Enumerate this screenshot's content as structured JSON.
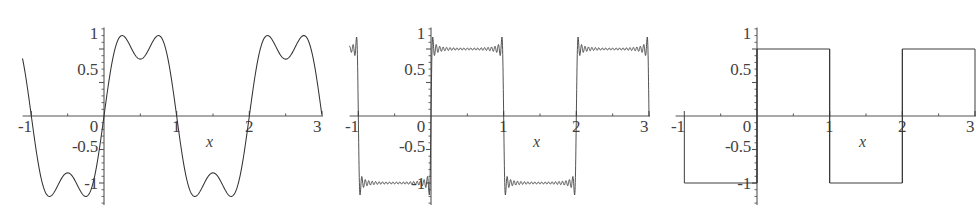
{
  "figure": {
    "kind": "three-panel-plot",
    "background": "#ffffff",
    "ink_color": "#333333",
    "axis_color": "#555555"
  },
  "axis_labels": {
    "x_variable": "x",
    "y_ticks": [
      "1",
      "0.5",
      "0",
      "-0.5",
      "-1"
    ],
    "x_ticks": [
      "-1",
      "0",
      "1",
      "2",
      "3"
    ]
  },
  "chart_data": [
    {
      "type": "line",
      "title": "",
      "xlabel": "x",
      "ylabel": "",
      "xlim": [
        -1.15,
        3.05
      ],
      "ylim": [
        -1.3,
        1.3
      ],
      "xticks": [
        -1,
        0,
        1,
        2,
        3
      ],
      "xticklabels": [
        "-1",
        "0",
        "1",
        "2",
        "3"
      ],
      "yticks": [
        -1,
        -0.5,
        0,
        0.5,
        1
      ],
      "yticklabels": [
        "-1",
        "-0.5",
        "0",
        "0.5",
        "1"
      ],
      "grid": false,
      "legend": null,
      "series": [
        {
          "name": "Fourier partial sum (2 terms)",
          "description": "Square wave approximation with terms n=1,3: smooth double-humped lobes",
          "harmonics": [
            1,
            3
          ],
          "amplitude_overshoot": 1.18,
          "amplitude_dip": 0.85,
          "period": 2
        }
      ]
    },
    {
      "type": "line",
      "title": "",
      "xlabel": "x",
      "ylabel": "",
      "xlim": [
        -1.15,
        3.05
      ],
      "ylim": [
        -1.3,
        1.3
      ],
      "xticks": [
        -1,
        0,
        1,
        2,
        3
      ],
      "xticklabels": [
        "-1",
        "0",
        "1",
        "2",
        "3"
      ],
      "yticks": [
        -1,
        -0.5,
        0,
        0.5,
        1
      ],
      "yticklabels": [
        "-1",
        "-0.5",
        "0",
        "0.5",
        "1"
      ],
      "grid": false,
      "legend": null,
      "series": [
        {
          "name": "Fourier partial sum (many terms)",
          "description": "Square wave approximation showing Gibbs ringing along the flat tops and bottoms with overshoot spikes at the jumps",
          "harmonics_odd_up_to": 41,
          "amplitude_overshoot": 1.18,
          "plateau": 1.0,
          "period": 2
        }
      ]
    },
    {
      "type": "line",
      "title": "",
      "xlabel": "x",
      "ylabel": "",
      "xlim": [
        -1.15,
        3.05
      ],
      "ylim": [
        -1.3,
        1.3
      ],
      "xticks": [
        -1,
        0,
        1,
        2,
        3
      ],
      "xticklabels": [
        "-1",
        "0",
        "1",
        "2",
        "3"
      ],
      "yticks": [
        -1,
        -0.5,
        0,
        0.5,
        1
      ],
      "yticklabels": [
        "-1",
        "-0.5",
        "0",
        "0.5",
        "1"
      ],
      "grid": false,
      "legend": null,
      "series": [
        {
          "name": "Square wave (converged)",
          "description": "Ideal square wave: +1 on (0,1) and (2,3), -1 on (-1,0) and (1,2)",
          "plateau": 1.0,
          "period": 2,
          "segments": [
            {
              "from": -1,
              "to": 0,
              "value": -1
            },
            {
              "from": 0,
              "to": 1,
              "value": 1
            },
            {
              "from": 1,
              "to": 2,
              "value": -1
            },
            {
              "from": 2,
              "to": 3,
              "value": 1
            }
          ]
        }
      ]
    }
  ],
  "panels": [
    {
      "id": "panel-0",
      "name": "fourier-2-terms",
      "y_labels": [
        {
          "text": "1",
          "x": 86,
          "y": 25
        },
        {
          "text": "0.5",
          "x": 70,
          "y": 61
        },
        {
          "text": "0",
          "x": 86,
          "y": 118
        },
        {
          "text": "-0.5",
          "x": 64,
          "y": 138
        },
        {
          "text": "-1",
          "x": 76,
          "y": 175
        }
      ],
      "x_labels": [
        {
          "text": "-1",
          "x": 20,
          "y": 118
        },
        {
          "text": "1",
          "x": 172,
          "y": 118
        },
        {
          "text": "2",
          "x": 245,
          "y": 118
        },
        {
          "text": "3",
          "x": 314,
          "y": 118
        }
      ],
      "x_var": {
        "text": "x",
        "x": 206,
        "y": 134
      }
    },
    {
      "id": "panel-1",
      "name": "fourier-many-terms-gibbs",
      "y_labels": [
        {
          "text": "1",
          "x": 86,
          "y": 25
        },
        {
          "text": "0.5",
          "x": 70,
          "y": 61
        },
        {
          "text": "0",
          "x": 86,
          "y": 118
        },
        {
          "text": "-0.5",
          "x": 64,
          "y": 138
        },
        {
          "text": "-1",
          "x": 76,
          "y": 175
        }
      ],
      "x_labels": [
        {
          "text": "-1",
          "x": 20,
          "y": 118
        },
        {
          "text": "1",
          "x": 172,
          "y": 118
        },
        {
          "text": "2",
          "x": 245,
          "y": 118
        },
        {
          "text": "3",
          "x": 314,
          "y": 118
        }
      ],
      "x_var": {
        "text": "x",
        "x": 206,
        "y": 134
      }
    },
    {
      "id": "panel-2",
      "name": "ideal-square-wave",
      "y_labels": [
        {
          "text": "1",
          "x": 86,
          "y": 25
        },
        {
          "text": "0.5",
          "x": 70,
          "y": 61
        },
        {
          "text": "0",
          "x": 86,
          "y": 118
        },
        {
          "text": "-0.5",
          "x": 64,
          "y": 138
        },
        {
          "text": "-1",
          "x": 76,
          "y": 175
        }
      ],
      "x_labels": [
        {
          "text": "-1",
          "x": 20,
          "y": 118
        },
        {
          "text": "1",
          "x": 172,
          "y": 118
        },
        {
          "text": "2",
          "x": 245,
          "y": 118
        },
        {
          "text": "3",
          "x": 314,
          "y": 118
        }
      ],
      "x_var": {
        "text": "x",
        "x": 206,
        "y": 134
      }
    }
  ]
}
